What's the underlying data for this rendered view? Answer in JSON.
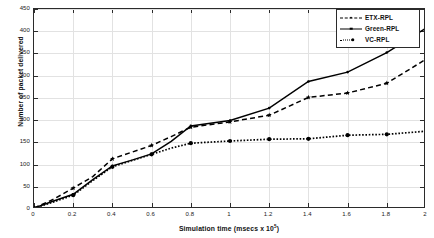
{
  "chart_data": {
    "type": "line",
    "title": "",
    "xlabel": "Simulation time (msecs x 10^5)",
    "xlabel_text": "Simulation time (msecs x 10",
    "xlabel_sup": "5",
    "xlabel_tail": ")",
    "ylabel": "Number of packet delivered",
    "xlim": [
      0,
      2
    ],
    "ylim": [
      0,
      450
    ],
    "xticks": [
      "0",
      "0.2",
      "0.4",
      "0.6",
      "0.8",
      "1",
      "1.2",
      "1.4",
      "1.6",
      "1.8",
      "2"
    ],
    "xtick_values": [
      0,
      0.2,
      0.4,
      0.6,
      0.8,
      1.0,
      1.2,
      1.4,
      1.6,
      1.8,
      2.0
    ],
    "yticks": [
      "0",
      "50",
      "100",
      "150",
      "200",
      "250",
      "300",
      "350",
      "400",
      "450"
    ],
    "ytick_values": [
      0,
      50,
      100,
      150,
      200,
      250,
      300,
      350,
      400,
      450
    ],
    "grid": true,
    "legend_position": "top-right",
    "x": [
      0,
      0.1,
      0.2,
      0.3,
      0.4,
      0.5,
      0.6,
      0.7,
      0.8,
      1.0,
      1.2,
      1.4,
      1.6,
      1.8,
      2.0
    ],
    "series": [
      {
        "name": "ETX-RPL",
        "style": "dashed",
        "marker": "star",
        "color": "#000000",
        "values": [
          2,
          22,
          47,
          73,
          113,
          128,
          143,
          163,
          184,
          196,
          211,
          251,
          261,
          283,
          337
        ]
      },
      {
        "name": "Green-RPL",
        "style": "solid",
        "marker": "point",
        "color": "#000000",
        "values": [
          2,
          18,
          33,
          66,
          97,
          110,
          124,
          152,
          187,
          199,
          227,
          287,
          308,
          352,
          407
        ]
      },
      {
        "name": "VC-RPL",
        "style": "dotted",
        "marker": "circle",
        "color": "#000000",
        "values": [
          2,
          16,
          31,
          64,
          95,
          109,
          123,
          137,
          148,
          153,
          157,
          158,
          166,
          168,
          175
        ]
      }
    ]
  },
  "legend": {
    "items": [
      {
        "label": "ETX-RPL",
        "sample": "dashed-star"
      },
      {
        "label": "Green-RPL",
        "sample": "solid-point"
      },
      {
        "label": "VC-RPL",
        "sample": "dotted-circle"
      }
    ]
  },
  "colors": {
    "axis": "#2b2b2b",
    "grid": "#e2e2e2",
    "series": "#000000",
    "background": "#ffffff"
  }
}
